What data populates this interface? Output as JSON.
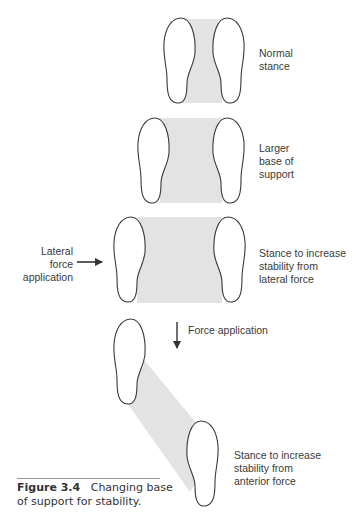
{
  "figure": {
    "number": "Figure 3.4",
    "caption": "Changing base of support for stability.",
    "shade_color": "#e3e3e3",
    "outline_color": "#3a3a3a"
  },
  "stances": [
    {
      "label": "Normal\nstance"
    },
    {
      "label": "Larger\nbase of\nsupport"
    },
    {
      "label": "Stance to increase\nstability from\nlateral force"
    },
    {
      "label": "Stance to increase\nstability from\nanterior force"
    }
  ],
  "annotations": {
    "lateral_force": "Lateral\nforce\napplication",
    "force_application": "Force application"
  }
}
